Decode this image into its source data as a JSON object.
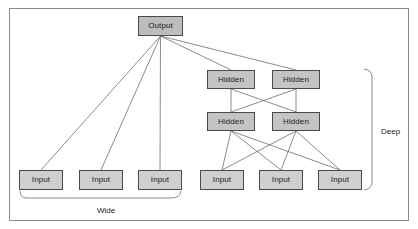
{
  "figure": {
    "title": "",
    "frame": {
      "x": 9,
      "y": 8,
      "width": 400,
      "height": 213,
      "border_color": "#8a8a8a"
    },
    "node_fill": "#c9c9c9",
    "node_stroke": "#4a4a4a",
    "edge_color": "#6e6e6e",
    "background": "#ffffff"
  },
  "chart_data": {
    "type": "diagram",
    "title": "",
    "nodes": [
      {
        "id": "output",
        "label": "Output",
        "role": "output",
        "x": 138,
        "y": 16,
        "w": 45,
        "h": 20
      },
      {
        "id": "hidden_tl",
        "label": "Hidden",
        "role": "hidden",
        "x": 207,
        "y": 70,
        "w": 48,
        "h": 19
      },
      {
        "id": "hidden_tr",
        "label": "Hidden",
        "role": "hidden",
        "x": 272,
        "y": 70,
        "w": 48,
        "h": 19
      },
      {
        "id": "hidden_bl",
        "label": "Hidden",
        "role": "hidden",
        "x": 207,
        "y": 112,
        "w": 48,
        "h": 19
      },
      {
        "id": "hidden_br",
        "label": "Hidden",
        "role": "hidden",
        "x": 272,
        "y": 112,
        "w": 48,
        "h": 19
      },
      {
        "id": "input_w1",
        "label": "Input",
        "role": "input",
        "x": 19,
        "y": 170,
        "w": 44,
        "h": 20
      },
      {
        "id": "input_w2",
        "label": "Input",
        "role": "input",
        "x": 79,
        "y": 170,
        "w": 44,
        "h": 20
      },
      {
        "id": "input_w3",
        "label": "Input",
        "role": "input",
        "x": 138,
        "y": 170,
        "w": 44,
        "h": 20
      },
      {
        "id": "input_d1",
        "label": "Input",
        "role": "input",
        "x": 200,
        "y": 170,
        "w": 44,
        "h": 20
      },
      {
        "id": "input_d2",
        "label": "Input",
        "role": "input",
        "x": 259,
        "y": 170,
        "w": 44,
        "h": 20
      },
      {
        "id": "input_d3",
        "label": "Input",
        "role": "input",
        "x": 318,
        "y": 170,
        "w": 44,
        "h": 20
      }
    ],
    "edges": [
      {
        "from": "output",
        "to": "input_w1"
      },
      {
        "from": "output",
        "to": "input_w2"
      },
      {
        "from": "output",
        "to": "input_w3"
      },
      {
        "from": "output",
        "to": "hidden_tl"
      },
      {
        "from": "output",
        "to": "hidden_tr"
      },
      {
        "from": "hidden_tl",
        "to": "hidden_bl"
      },
      {
        "from": "hidden_tl",
        "to": "hidden_br"
      },
      {
        "from": "hidden_tr",
        "to": "hidden_bl"
      },
      {
        "from": "hidden_tr",
        "to": "hidden_br"
      },
      {
        "from": "hidden_bl",
        "to": "input_d1"
      },
      {
        "from": "hidden_bl",
        "to": "input_d2"
      },
      {
        "from": "hidden_bl",
        "to": "input_d3"
      },
      {
        "from": "hidden_br",
        "to": "input_d1"
      },
      {
        "from": "hidden_br",
        "to": "input_d2"
      },
      {
        "from": "hidden_br",
        "to": "input_d3"
      }
    ],
    "annotations": [
      {
        "id": "wide",
        "label": "Wide",
        "orientation": "horizontal",
        "spans": [
          "input_w1",
          "input_w2",
          "input_w3"
        ],
        "label_x": 108,
        "label_y": 211
      },
      {
        "id": "deep",
        "label": "Deep",
        "orientation": "vertical",
        "spans": [
          "hidden_tl",
          "hidden_tr",
          "hidden_bl",
          "hidden_br",
          "input_d1",
          "input_d2",
          "input_d3"
        ],
        "label_x": 391,
        "label_y": 132
      }
    ]
  }
}
